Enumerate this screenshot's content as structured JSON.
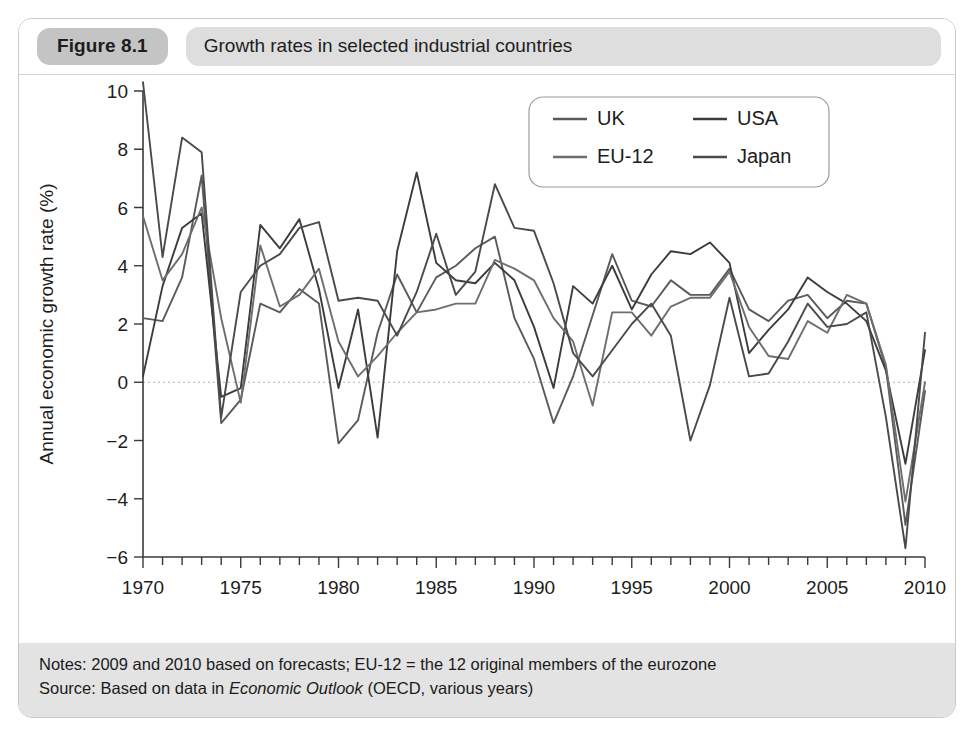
{
  "figure": {
    "badge_label": "Figure 8.1",
    "title": "Growth rates in selected industrial countries"
  },
  "notes": {
    "notes_prefix": "Notes: 2009 and 2010 based on forecasts; EU-12 = the 12 original members of the eurozone",
    "source_prefix": "Source: Based on data in ",
    "source_italic": "Economic Outlook",
    "source_suffix": " (OECD, various years)"
  },
  "colors": {
    "uk": "#5a5a5a",
    "usa": "#3c3c3c",
    "eu12": "#6e6e6e",
    "japan": "#4a4a4a",
    "axis": "#3a3a3a",
    "badge_bg": "#c4c4c4",
    "title_bg": "#dedede",
    "notes_bg": "#e3e3e3",
    "frame_border": "#c9c9c9"
  },
  "chart_data": {
    "type": "line",
    "title": "Growth rates in selected industrial countries",
    "xlabel": "",
    "ylabel": "Annual economic growth rate (%)",
    "xlim": [
      1970,
      2010
    ],
    "ylim": [
      -6,
      10
    ],
    "ytick_step": 2,
    "yticks": [
      -6,
      -4,
      -2,
      0,
      2,
      4,
      6,
      8,
      10
    ],
    "xticks_major": [
      1970,
      1975,
      1980,
      1985,
      1990,
      1995,
      2000,
      2005,
      2010
    ],
    "xtick_minor_step": 1,
    "grid": "zero-line-only",
    "legend_position": "top-right-inside",
    "legend_entries": [
      "UK",
      "USA",
      "EU-12",
      "Japan"
    ],
    "x": [
      1970,
      1971,
      1972,
      1973,
      1974,
      1975,
      1976,
      1977,
      1978,
      1979,
      1980,
      1981,
      1982,
      1983,
      1984,
      1985,
      1986,
      1987,
      1988,
      1989,
      1990,
      1991,
      1992,
      1993,
      1994,
      1995,
      1996,
      1997,
      1998,
      1999,
      2000,
      2001,
      2002,
      2003,
      2004,
      2005,
      2006,
      2007,
      2008,
      2009,
      2010
    ],
    "series": [
      {
        "name": "UK",
        "values": [
          2.2,
          2.1,
          3.6,
          7.1,
          -1.4,
          -0.6,
          2.7,
          2.4,
          3.2,
          2.7,
          -2.1,
          -1.3,
          1.7,
          3.7,
          2.4,
          3.6,
          4.0,
          4.6,
          5.0,
          2.2,
          0.8,
          -1.4,
          0.2,
          2.3,
          4.4,
          2.8,
          2.6,
          3.5,
          3.0,
          3.0,
          3.9,
          2.5,
          2.1,
          2.8,
          3.0,
          2.2,
          2.8,
          2.7,
          0.5,
          -4.9,
          -0.3
        ]
      },
      {
        "name": "USA",
        "values": [
          0.2,
          3.3,
          5.3,
          5.8,
          -0.5,
          -0.2,
          5.4,
          4.6,
          5.6,
          3.2,
          -0.2,
          2.5,
          -1.9,
          4.5,
          7.2,
          4.1,
          3.5,
          3.4,
          4.1,
          3.5,
          1.9,
          -0.2,
          3.3,
          2.7,
          4.0,
          2.5,
          3.7,
          4.5,
          4.4,
          4.8,
          4.1,
          1.0,
          1.8,
          2.5,
          3.6,
          3.1,
          2.7,
          2.1,
          0.4,
          -2.8,
          1.1
        ]
      },
      {
        "name": "EU-12",
        "values": [
          5.7,
          3.5,
          4.4,
          6.0,
          2.2,
          -0.7,
          4.7,
          2.6,
          3.0,
          3.9,
          1.4,
          0.2,
          0.9,
          1.7,
          2.4,
          2.5,
          2.7,
          2.7,
          4.2,
          3.9,
          3.5,
          2.2,
          1.4,
          -0.8,
          2.4,
          2.4,
          1.6,
          2.6,
          2.9,
          2.9,
          3.8,
          1.9,
          0.9,
          0.8,
          2.1,
          1.7,
          3.0,
          2.7,
          0.6,
          -4.1,
          0.0
        ]
      },
      {
        "name": "Japan",
        "values": [
          10.3,
          4.3,
          8.4,
          7.9,
          -1.2,
          3.1,
          4.0,
          4.4,
          5.3,
          5.5,
          2.8,
          2.9,
          2.8,
          1.6,
          3.1,
          5.1,
          3.0,
          3.8,
          6.8,
          5.3,
          5.2,
          3.4,
          1.0,
          0.2,
          1.1,
          2.0,
          2.7,
          1.6,
          -2.0,
          -0.1,
          2.9,
          0.2,
          0.3,
          1.4,
          2.7,
          1.9,
          2.0,
          2.4,
          -1.2,
          -5.7,
          1.7
        ]
      }
    ],
    "annotations": [
      "2009 and 2010 based on forecasts",
      "EU-12 = the 12 original members of the eurozone"
    ]
  }
}
